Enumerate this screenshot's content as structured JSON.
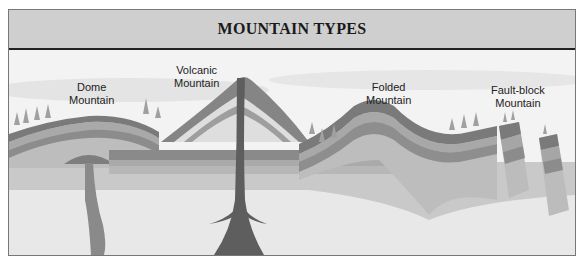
{
  "title": "MOUNTAIN TYPES",
  "labels": {
    "dome": [
      "Dome",
      "Mountain"
    ],
    "volcanic": [
      "Volcanic",
      "Mountain"
    ],
    "folded": [
      "Folded",
      "Mountain"
    ],
    "fault_block": [
      "Fault-block",
      "Mountain"
    ]
  },
  "colors": {
    "title_bar": "#cfcfcf",
    "layer_dark": "#7d7d7d",
    "layer_mid": "#9a9a9a",
    "layer_light": "#b8b8b8",
    "layer_pale": "#cdcdcd",
    "magma": "#6a6a6a",
    "sky": "#f0f0f0"
  }
}
